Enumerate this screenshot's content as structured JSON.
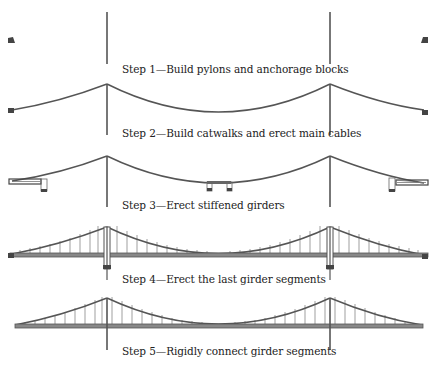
{
  "figure": {
    "type": "bridge-construction-sequence",
    "colors": {
      "line": "#555555",
      "dark": "#444444",
      "light": "#999999",
      "text": "#222222",
      "background": "#ffffff"
    }
  },
  "steps": [
    {
      "number": 1,
      "label": "Step 1—Build pylons and anchorage blocks"
    },
    {
      "number": 2,
      "label": "Step 2—Build catwalks and erect main cables"
    },
    {
      "number": 3,
      "label": "Step 3—Erect stiffened girders"
    },
    {
      "number": 4,
      "label": "Step 4—Erect the last girder segments"
    },
    {
      "number": 5,
      "label": "Step 5—Rigidly connect girder segments"
    }
  ]
}
